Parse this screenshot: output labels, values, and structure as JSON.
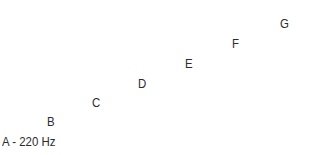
{
  "diagram": {
    "type": "note-frequency-scale",
    "background_color": "#ffffff",
    "text_color": "#2b2b2b",
    "notes": [
      {
        "label": "A - 220 Hz",
        "name": "A",
        "frequency_hz": 220,
        "x": 2,
        "y": 148
      },
      {
        "label": "B",
        "name": "B",
        "x": 47,
        "y": 128
      },
      {
        "label": "C",
        "name": "C",
        "x": 92,
        "y": 109
      },
      {
        "label": "D",
        "name": "D",
        "x": 138,
        "y": 90
      },
      {
        "label": "E",
        "name": "E",
        "x": 185,
        "y": 70
      },
      {
        "label": "F",
        "name": "F",
        "x": 232,
        "y": 50
      },
      {
        "label": "G",
        "name": "G",
        "x": 280,
        "y": 30
      }
    ]
  }
}
